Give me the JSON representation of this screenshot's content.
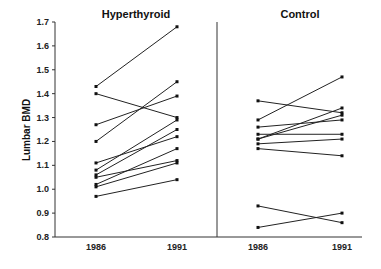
{
  "chart_data": {
    "type": "line",
    "title": "",
    "ylabel": "Lumbar BMD",
    "xlabel": "",
    "ylim": [
      0.8,
      1.7
    ],
    "yticks": [
      0.8,
      0.9,
      1.0,
      1.1,
      1.2,
      1.3,
      1.4,
      1.5,
      1.6,
      1.7
    ],
    "grid": false,
    "legend": null,
    "panels": [
      {
        "title": "Hyperthyroid",
        "categories": [
          "1986",
          "1991"
        ],
        "series": [
          {
            "name": "subject-1",
            "values": [
              1.43,
              1.68
            ]
          },
          {
            "name": "subject-2",
            "values": [
              1.4,
              1.3
            ]
          },
          {
            "name": "subject-3",
            "values": [
              1.27,
              1.39
            ]
          },
          {
            "name": "subject-4",
            "values": [
              1.2,
              1.45
            ]
          },
          {
            "name": "subject-5",
            "values": [
              1.11,
              1.22
            ]
          },
          {
            "name": "subject-6",
            "values": [
              1.08,
              1.29
            ]
          },
          {
            "name": "subject-7",
            "values": [
              1.06,
              1.25
            ]
          },
          {
            "name": "subject-8",
            "values": [
              1.05,
              1.12
            ]
          },
          {
            "name": "subject-9",
            "values": [
              1.02,
              1.17
            ]
          },
          {
            "name": "subject-10",
            "values": [
              1.01,
              1.11
            ]
          },
          {
            "name": "subject-11",
            "values": [
              0.97,
              1.04
            ]
          }
        ]
      },
      {
        "title": "Control",
        "categories": [
          "1986",
          "1991"
        ],
        "series": [
          {
            "name": "subject-1",
            "values": [
              1.37,
              1.32
            ]
          },
          {
            "name": "subject-2",
            "values": [
              1.29,
              1.47
            ]
          },
          {
            "name": "subject-3",
            "values": [
              1.26,
              1.29
            ]
          },
          {
            "name": "subject-4",
            "values": [
              1.23,
              1.23
            ]
          },
          {
            "name": "subject-5",
            "values": [
              1.21,
              1.34
            ]
          },
          {
            "name": "subject-6",
            "values": [
              1.21,
              1.31
            ]
          },
          {
            "name": "subject-7",
            "values": [
              1.19,
              1.21
            ]
          },
          {
            "name": "subject-8",
            "values": [
              1.17,
              1.14
            ]
          },
          {
            "name": "subject-9",
            "values": [
              0.93,
              0.86
            ]
          },
          {
            "name": "subject-10",
            "values": [
              0.84,
              0.9
            ]
          }
        ]
      }
    ]
  },
  "labels": {
    "ylabel": "Lumbar BMD",
    "panel_left_title": "Hyperthyroid",
    "panel_right_title": "Control",
    "x_left_1": "1986",
    "x_left_2": "1991",
    "x_right_1": "1986",
    "x_right_2": "1991"
  },
  "colors": {
    "ink": "#222222",
    "background": "#ffffff"
  }
}
